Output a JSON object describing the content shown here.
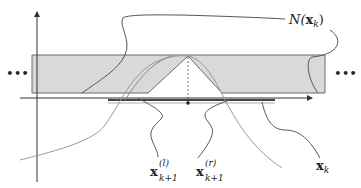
{
  "diagram": {
    "type": "neighborhood-illustration",
    "colors": {
      "band_fill": "#d9d9d9",
      "band_stroke": "#6a6a6a",
      "axis": "#333333",
      "curve_dark": "#555555",
      "curve_light": "#9a9a9a",
      "segment": "#444444",
      "text": "#222222"
    },
    "ellipsis_left": "•••",
    "ellipsis_right": "•••",
    "labels": {
      "neighborhood": {
        "prefix": "N(",
        "var": "x",
        "sub": "k",
        "suffix": ")"
      },
      "x_left": {
        "var": "x",
        "sup": "(l)",
        "sub": "k+1"
      },
      "x_right": {
        "var": "x",
        "sup": "(r)",
        "sub": "k+1"
      },
      "x_k": {
        "var": "x",
        "sub": "k"
      }
    }
  }
}
